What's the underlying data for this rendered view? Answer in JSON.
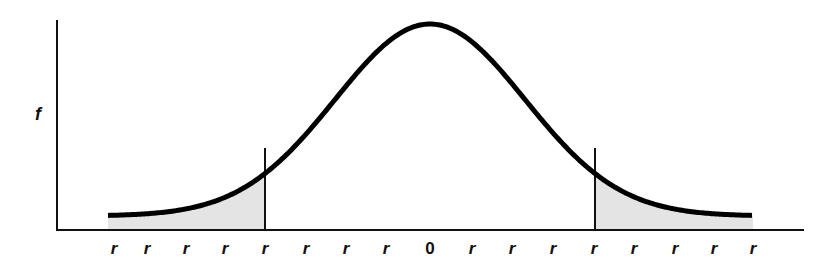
{
  "chart_data": {
    "type": "area",
    "title": "",
    "xlabel": "",
    "ylabel": "f",
    "x_ticks": [
      "r",
      "r",
      "r",
      "r",
      "r",
      "r",
      "r",
      "r",
      "0",
      "r",
      "r",
      "r",
      "r",
      "r",
      "r",
      "r",
      "r"
    ],
    "center_label": "0",
    "cutoffs": {
      "left_tick_index": 4,
      "right_tick_index": 12
    },
    "shaded_regions": [
      "left-tail",
      "right-tail"
    ],
    "colors": {
      "curve": "#000000",
      "shade": "#e4e4e4",
      "axis": "#111111"
    },
    "grid": false,
    "legend": null
  },
  "labels": {
    "y_axis": "f",
    "ticks": [
      "r",
      "r",
      "r",
      "r",
      "r",
      "r",
      "r",
      "r",
      "0",
      "r",
      "r",
      "r",
      "r",
      "r",
      "r",
      "r",
      "r"
    ]
  }
}
